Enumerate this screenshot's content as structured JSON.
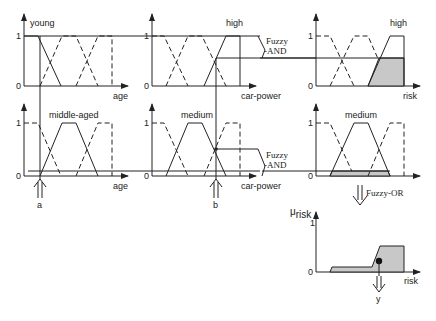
{
  "diagram": {
    "row1": {
      "age": {
        "set_label": "young",
        "axis_label": "age",
        "y1": "1",
        "y0": "0"
      },
      "car_power": {
        "set_label": "high",
        "axis_label": "car-power",
        "y1": "1",
        "y0": "0"
      },
      "operator": {
        "line1": "Fuzzy",
        "line2": "-AND"
      },
      "risk": {
        "set_label": "high",
        "axis_label": "risk",
        "y1": "1",
        "y0": "0"
      }
    },
    "row2": {
      "age": {
        "set_label": "middle-aged",
        "axis_label": "age",
        "y1": "1",
        "y0": "0"
      },
      "car_power": {
        "set_label": "medium",
        "axis_label": "car-power",
        "y1": "1",
        "y0": "0"
      },
      "operator": {
        "line1": "Fuzzy",
        "line2": "-AND"
      },
      "risk": {
        "set_label": "medium",
        "axis_label": "risk",
        "y1": "1",
        "y0": "0"
      }
    },
    "inputs": {
      "a": "a",
      "b": "b"
    },
    "aggregation": {
      "label": "Fuzzy-OR"
    },
    "output": {
      "y_axis_label_main": "μ",
      "y_axis_label_sub": "risk",
      "axis_label": "risk",
      "y1": "1",
      "y0": "0",
      "result_label": "y"
    },
    "colors": {
      "line": "#222222",
      "fill": "#c8c8c8",
      "background": "#ffffff"
    }
  }
}
